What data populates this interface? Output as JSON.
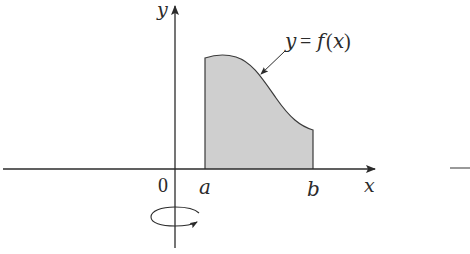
{
  "figure": {
    "labels": {
      "y_axis": "y",
      "x_axis": "x",
      "origin": "0",
      "a": "a",
      "b": "b",
      "curve_y": "y",
      "curve_eq": "=",
      "curve_f": "f",
      "curve_open": "(",
      "curve_x": "x",
      "curve_close": ")"
    },
    "colors": {
      "axis": "#2b2b2b",
      "region_fill": "#cfcfcf",
      "region_stroke": "#3a3a3a",
      "background": "#ffffff"
    },
    "rotation_indicator": "rotation-about-y-axis"
  }
}
